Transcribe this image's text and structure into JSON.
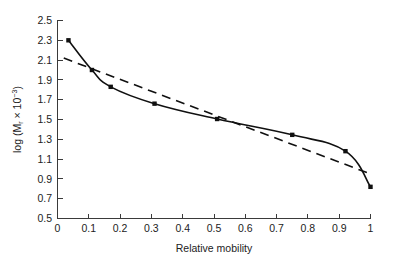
{
  "chart_data": {
    "type": "line",
    "title": "",
    "subtitle": "",
    "xlabel": "Relative mobility",
    "ylabel": "log (Mr x 10-3)",
    "ylabel_parts": {
      "prefix": "log (M",
      "subscript": "r",
      "middle": " × 10",
      "superscript": "−3",
      "suffix": ")"
    },
    "xlim": [
      0,
      1
    ],
    "ylim": [
      0.5,
      2.5
    ],
    "xticks": [
      "0",
      "0.1",
      "0.2",
      "0.3",
      "0.4",
      "0.5",
      "0.6",
      "0.7",
      "0.8",
      "0.9",
      "1"
    ],
    "xtick_values": [
      0,
      0.1,
      0.2,
      0.3,
      0.4,
      0.5,
      0.6,
      0.7,
      0.8,
      0.9,
      1.0
    ],
    "yticks": [
      "0.5",
      "0.7",
      "0.9",
      "1.1",
      "1.3",
      "1.5",
      "1.7",
      "1.9",
      "2.1",
      "2.3",
      "2.5"
    ],
    "ytick_values": [
      0.5,
      0.7,
      0.9,
      1.1,
      1.3,
      1.5,
      1.7,
      1.9,
      2.1,
      2.3,
      2.5
    ],
    "grid": false,
    "legend": "none",
    "legend_position": "none",
    "series": [
      {
        "name": "standard-curve",
        "style": "solid",
        "markers": true,
        "marker_shape": "square",
        "x": [
          0.035,
          0.11,
          0.17,
          0.31,
          0.51,
          0.75,
          0.92,
          1.0
        ],
        "values": [
          2.3,
          2.0,
          1.83,
          1.66,
          1.505,
          1.345,
          1.18,
          0.82
        ]
      },
      {
        "name": "linear-fit",
        "style": "dashed",
        "markers": false,
        "marker_shape": "none",
        "x": [
          0.02,
          1.0
        ],
        "values": [
          2.12,
          0.95
        ]
      }
    ],
    "annotations": []
  },
  "figure": {
    "background_color": "#ffffff",
    "axis_color": "#3a3a3a",
    "line_color": "#101010",
    "text_color": "#222222"
  }
}
